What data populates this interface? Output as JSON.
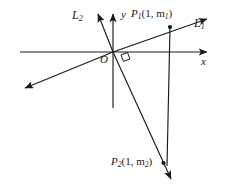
{
  "figure": {
    "background_color": "#ffffff",
    "stroke_color": "#1a1a1a",
    "width": 225,
    "height": 186,
    "labels": {
      "line1": "L",
      "line1_sub": "1",
      "line2": "L",
      "line2_sub": "2",
      "x_axis": "x",
      "y_axis": "y",
      "origin": "O",
      "point1_name": "P",
      "point1_sub": "1",
      "point1_coords": "(1, m",
      "point1_coord_sub": "1",
      "point1_coords_end": ")",
      "point2_name": "P",
      "point2_sub": "2",
      "point2_coords": "(1, m",
      "point2_coord_sub": "2",
      "point2_coords_end": ")"
    },
    "geometry": {
      "origin": {
        "x": 113,
        "y": 52
      },
      "x_axis": {
        "x1": 20,
        "y1": 52,
        "x2": 210,
        "y2": 52
      },
      "y_axis": {
        "x1": 113,
        "y1": 12,
        "x2": 113,
        "y2": 108
      },
      "line_L1": {
        "x1": 23,
        "y1": 89,
        "x2": 209,
        "y2": 18
      },
      "line_L2": {
        "x1": 97,
        "y1": 12,
        "x2": 172,
        "y2": 181
      },
      "point_P1": {
        "x": 170,
        "y": 27
      },
      "point_P2": {
        "x": 163,
        "y": 163
      },
      "segment_P1_P2": {
        "x1": 170,
        "y1": 27,
        "x2": 167,
        "y2": 165
      },
      "right_angle_marker": {
        "x": 118,
        "y": 52,
        "size": 9
      }
    }
  }
}
